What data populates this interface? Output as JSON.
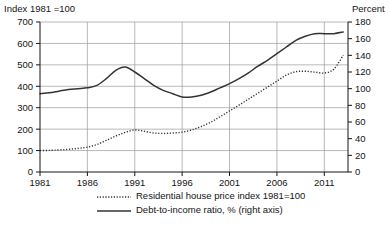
{
  "chart_data": {
    "type": "line",
    "title": "",
    "left_axis_label": "Index 1981 =100",
    "right_axis_label": "Percent",
    "xlabel": "",
    "xlim": [
      1981,
      2013.5
    ],
    "ylim_left": [
      0,
      700
    ],
    "ylim_right": [
      0,
      180
    ],
    "left_ticks": [
      0,
      100,
      200,
      300,
      400,
      500,
      600,
      700
    ],
    "right_ticks": [
      0,
      20,
      40,
      60,
      80,
      100,
      120,
      140,
      160,
      180
    ],
    "x_ticks": [
      1981,
      1986,
      1991,
      1996,
      2001,
      2006,
      2011
    ],
    "x_tick_labels": [
      "1981",
      "1986",
      "1991",
      "1996",
      "2001",
      "2006",
      "2011"
    ],
    "grid": "horizontal-and-vertical",
    "legend_position": "below",
    "series": [
      {
        "name": "Residential house price index 1981=100",
        "axis": "left",
        "style": "dotted",
        "color": "#333333",
        "x": [
          1981,
          1982,
          1983,
          1984,
          1985,
          1986,
          1987,
          1988,
          1989,
          1990,
          1991,
          1992,
          1993,
          1994,
          1995,
          1996,
          1997,
          1998,
          1999,
          2000,
          2001,
          2002,
          2003,
          2004,
          2005,
          2006,
          2007,
          2008,
          2009,
          2010,
          2011,
          2012,
          2013
        ],
        "values": [
          100,
          101,
          103,
          106,
          110,
          116,
          128,
          148,
          168,
          185,
          196,
          190,
          182,
          180,
          182,
          186,
          196,
          212,
          232,
          258,
          285,
          312,
          340,
          368,
          396,
          424,
          452,
          468,
          470,
          466,
          462,
          480,
          545
        ]
      },
      {
        "name": "Debt-to-income ratio, % (right axis)",
        "axis": "right",
        "style": "solid",
        "color": "#333333",
        "x": [
          1981,
          1982,
          1983,
          1984,
          1985,
          1986,
          1987,
          1988,
          1989,
          1990,
          1991,
          1992,
          1993,
          1994,
          1995,
          1996,
          1997,
          1998,
          1999,
          2000,
          2001,
          2002,
          2003,
          2004,
          2005,
          2006,
          2007,
          2008,
          2009,
          2010,
          2011,
          2012,
          2013
        ],
        "values": [
          94,
          95,
          97,
          99,
          100,
          101,
          104,
          112,
          122,
          126,
          120,
          112,
          104,
          98,
          94,
          90,
          90,
          92,
          96,
          101,
          106,
          112,
          119,
          127,
          134,
          142,
          150,
          158,
          163,
          166,
          166,
          166,
          168
        ]
      }
    ],
    "legend": [
      {
        "label": "Residential house price index 1981=100",
        "style": "dotted"
      },
      {
        "label": "Debt-to-income ratio, % (right axis)",
        "style": "solid"
      }
    ]
  }
}
